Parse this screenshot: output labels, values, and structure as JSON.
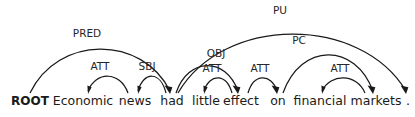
{
  "figure": {
    "kind": "dependency-parse-tree",
    "width": 415,
    "height": 117,
    "background_color": "#ffffff",
    "ink_color": "#1a1a1a",
    "label_color": "#262626",
    "baseline_y": 105
  },
  "tokens": [
    {
      "id": 0,
      "text": "ROOT",
      "x": 30,
      "bold": true
    },
    {
      "id": 1,
      "text": "Economic",
      "x": 83,
      "bold": false
    },
    {
      "id": 2,
      "text": "news",
      "x": 135,
      "bold": false
    },
    {
      "id": 3,
      "text": "had",
      "x": 172,
      "bold": false
    },
    {
      "id": 4,
      "text": "little",
      "x": 206,
      "bold": false
    },
    {
      "id": 5,
      "text": "effect",
      "x": 241,
      "bold": false
    },
    {
      "id": 6,
      "text": "on",
      "x": 278,
      "bold": false
    },
    {
      "id": 7,
      "text": "financial",
      "x": 320,
      "bold": false
    },
    {
      "id": 8,
      "text": "markets",
      "x": 376,
      "bold": false
    },
    {
      "id": 9,
      "text": ".",
      "x": 408,
      "bold": false
    }
  ],
  "arcs": [
    {
      "label": "PRED",
      "head_token": "ROOT",
      "dependent_token": "had",
      "direction": "right",
      "start_x": 30,
      "end_x": 170,
      "apex_y": 40,
      "label_x": 87,
      "label_y": 37
    },
    {
      "label": "ATT",
      "head_token": "news",
      "dependent_token": "Economic",
      "direction": "left",
      "start_x": 128,
      "end_x": 88,
      "apex_y": 73,
      "label_x": 100,
      "label_y": 70
    },
    {
      "label": "SBJ",
      "head_token": "had",
      "dependent_token": "news",
      "direction": "left",
      "start_x": 166,
      "end_x": 138,
      "apex_y": 73,
      "label_x": 147,
      "label_y": 70
    },
    {
      "label": "OBJ",
      "head_token": "had",
      "dependent_token": "effect",
      "direction": "right",
      "start_x": 176,
      "end_x": 238,
      "apex_y": 60,
      "label_x": 216,
      "label_y": 57
    },
    {
      "label": "ATT",
      "head_token": "effect",
      "dependent_token": "little",
      "direction": "left",
      "start_x": 232,
      "end_x": 204,
      "apex_y": 75,
      "label_x": 212,
      "label_y": 72
    },
    {
      "label": "ATT",
      "head_token": "effect",
      "dependent_token": "on",
      "direction": "right",
      "start_x": 248,
      "end_x": 277,
      "apex_y": 75,
      "label_x": 260,
      "label_y": 72
    },
    {
      "label": "PC",
      "head_token": "on",
      "dependent_token": "markets",
      "direction": "right",
      "start_x": 283,
      "end_x": 373,
      "apex_y": 47,
      "label_x": 299,
      "label_y": 44
    },
    {
      "label": "ATT",
      "head_token": "markets",
      "dependent_token": "financial",
      "direction": "left",
      "start_x": 365,
      "end_x": 322,
      "apex_y": 75,
      "label_x": 340,
      "label_y": 72
    },
    {
      "label": "PU",
      "head_token": "had",
      "dependent_token": ".",
      "direction": "right",
      "start_x": 178,
      "end_x": 406,
      "apex_y": 22,
      "label_x": 280,
      "label_y": 14
    }
  ],
  "sentence": "Economic news had little effect on financial markets .",
  "relation_labels": [
    "PRED",
    "ATT",
    "SBJ",
    "OBJ",
    "ATT",
    "ATT",
    "PC",
    "ATT",
    "PU"
  ]
}
